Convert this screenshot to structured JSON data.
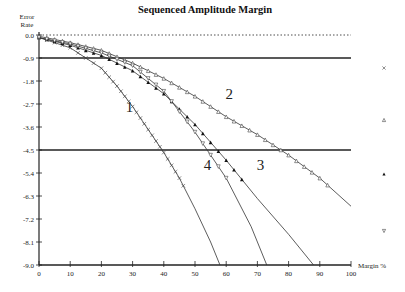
{
  "chart_data": {
    "type": "line",
    "title": "Sequenced Amplitude Margin",
    "xlabel": "Margin %",
    "ylabel": "Error Rate",
    "ylabel_lines": [
      "Error",
      "Rate"
    ],
    "xlim": [
      0,
      100
    ],
    "ylim": [
      -9.0,
      0.0
    ],
    "x_ticks": [
      "0",
      "10",
      "20",
      "30",
      "40",
      "50",
      "60",
      "70",
      "80",
      "90",
      "100"
    ],
    "y_ticks": [
      "0.0",
      "-0.9",
      "-1.8",
      "-2.7",
      "-3.6",
      "-4.5",
      "-5.4",
      "-6.3",
      "-7.2",
      "-8.1",
      "-9.0"
    ],
    "reference_lines": [
      {
        "y": 0.0,
        "style": "dotted"
      },
      {
        "y": -0.9,
        "style": "solid"
      },
      {
        "y": -4.5,
        "style": "solid"
      }
    ],
    "grid": false,
    "legend_position": "right",
    "series": [
      {
        "name": "1",
        "marker": "x",
        "label_pos": [
          29,
          -3.0
        ],
        "x": [
          0,
          10,
          20,
          25,
          30,
          35,
          40,
          45,
          50,
          55,
          58
        ],
        "values": [
          -0.1,
          -0.5,
          -1.3,
          -2.0,
          -2.8,
          -3.7,
          -4.6,
          -5.6,
          -6.8,
          -8.1,
          -9.0
        ]
      },
      {
        "name": "2",
        "marker": "open-triangle-up",
        "label_pos": [
          61,
          -2.5
        ],
        "x": [
          0,
          10,
          20,
          30,
          40,
          50,
          60,
          70,
          80,
          90,
          100
        ],
        "values": [
          -0.05,
          -0.3,
          -0.6,
          -1.1,
          -1.7,
          -2.4,
          -3.2,
          -3.9,
          -4.7,
          -5.6,
          -6.7
        ]
      },
      {
        "name": "3",
        "marker": "filled-triangle-up",
        "label_pos": [
          71,
          -5.3
        ],
        "x": [
          0,
          10,
          20,
          30,
          40,
          50,
          60,
          70,
          80,
          88
        ],
        "values": [
          -0.1,
          -0.4,
          -0.8,
          -1.4,
          -2.3,
          -3.5,
          -4.9,
          -6.4,
          -7.8,
          -9.0
        ]
      },
      {
        "name": "4",
        "marker": "open-triangle-down",
        "label_pos": [
          54,
          -5.3
        ],
        "x": [
          0,
          10,
          20,
          30,
          40,
          50,
          60,
          68,
          73
        ],
        "values": [
          -0.1,
          -0.35,
          -0.7,
          -1.2,
          -2.2,
          -3.8,
          -5.6,
          -7.5,
          -9.0
        ]
      }
    ]
  }
}
